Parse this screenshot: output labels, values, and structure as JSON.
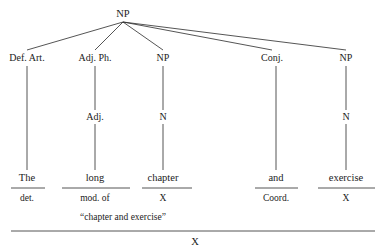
{
  "diagram": {
    "type": "syntax-tree",
    "title": "",
    "root": {
      "label": "NP",
      "x": 123,
      "y": 14
    },
    "phrase_nodes": [
      {
        "label": "Def. Art.",
        "x": 27,
        "y": 58
      },
      {
        "label": "Adj. Ph.",
        "x": 95,
        "y": 58
      },
      {
        "label": "NP",
        "x": 163,
        "y": 58
      },
      {
        "label": "Conj.",
        "x": 272,
        "y": 58
      },
      {
        "label": "NP",
        "x": 346,
        "y": 58
      }
    ],
    "mid_nodes": [
      {
        "label": "Adj.",
        "x": 95,
        "y": 117
      },
      {
        "label": "N",
        "x": 163,
        "y": 117
      },
      {
        "label": "N",
        "x": 346,
        "y": 117
      }
    ],
    "words": [
      {
        "label": "The",
        "x": 27,
        "y": 178
      },
      {
        "label": "long",
        "x": 95,
        "y": 178
      },
      {
        "label": "chapter",
        "x": 163,
        "y": 178
      },
      {
        "label": "and",
        "x": 276,
        "y": 178
      },
      {
        "label": "exercise",
        "x": 346,
        "y": 178
      }
    ],
    "functions": [
      {
        "label": "det.",
        "x": 27,
        "y": 199
      },
      {
        "label": "mod. of",
        "x": 95,
        "y": 199
      },
      {
        "label": "X",
        "x": 163,
        "y": 199
      },
      {
        "label": "Coord.",
        "x": 276,
        "y": 199
      },
      {
        "label": "X",
        "x": 346,
        "y": 199
      }
    ],
    "quote": {
      "label": "“chapter and exercise”",
      "x": 123,
      "y": 218
    },
    "final": {
      "label": "X",
      "x": 195,
      "y": 242
    },
    "colors": {
      "line": "#2a2a2a",
      "text": "#1b1b1b",
      "background": "#ffffff"
    }
  }
}
